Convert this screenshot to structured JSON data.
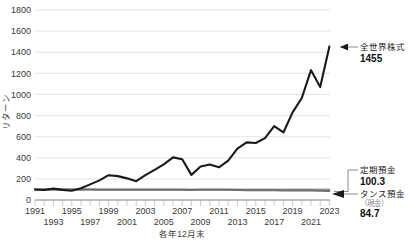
{
  "chart_data": {
    "type": "line",
    "title": "",
    "xlabel": "各年12月末",
    "ylabel": "リターン",
    "ylim": [
      0,
      1800
    ],
    "ytick_step": 200,
    "yticks": [
      "0",
      "200",
      "400",
      "600",
      "800",
      "1000",
      "1200",
      "1400",
      "1600",
      "1800"
    ],
    "xlim": [
      1991,
      2023
    ],
    "xticks_top": [
      "1991",
      "1995",
      "1999",
      "2003",
      "2007",
      "2011",
      "2015",
      "2019",
      "2023"
    ],
    "xticks_bottom": [
      "1993",
      "1997",
      "2001",
      "2005",
      "2009",
      "2013",
      "2017",
      "2021"
    ],
    "grid": true,
    "legend_position": "annotations-right",
    "x": [
      1991,
      1992,
      1993,
      1994,
      1995,
      1996,
      1997,
      1998,
      1999,
      2000,
      2001,
      2002,
      2003,
      2004,
      2005,
      2006,
      2007,
      2008,
      2009,
      2010,
      2011,
      2012,
      2013,
      2014,
      2015,
      2016,
      2017,
      2018,
      2019,
      2020,
      2021,
      2022,
      2023
    ],
    "series": [
      {
        "name": "全世界株式",
        "color": "#1a1a1a",
        "end_value": 1455,
        "values": [
          100,
          95,
          108,
          96,
          88,
          112,
          148,
          186,
          235,
          226,
          205,
          178,
          236,
          286,
          338,
          404,
          386,
          238,
          318,
          337,
          310,
          372,
          486,
          546,
          540,
          586,
          700,
          640,
          830,
          966,
          1230,
          1070,
          1455
        ]
      },
      {
        "name": "定期預金",
        "color": "#8c8c8c",
        "end_value": 100.3,
        "values": [
          100,
          100,
          100,
          100,
          100,
          100.1,
          100.1,
          100.1,
          100.1,
          100.1,
          100.2,
          100.2,
          100.2,
          100.2,
          100.2,
          100.2,
          100.2,
          100.3,
          100.3,
          100.3,
          100.3,
          100.3,
          100.3,
          100.3,
          100.3,
          100.3,
          100.3,
          100.3,
          100.3,
          100.3,
          100.3,
          100.3,
          100.3
        ]
      },
      {
        "name": "タンス預金（現金）",
        "color": "#5f5f5f",
        "end_value": 84.7,
        "values": [
          100,
          99.5,
          99.3,
          99.2,
          99.1,
          99.0,
          98.5,
          98.0,
          97.7,
          97.5,
          97.4,
          97.2,
          97.1,
          97.0,
          96.8,
          96.5,
          96.2,
          95.9,
          96.1,
          96.2,
          96.3,
          96.3,
          95.8,
          93.2,
          92.4,
          92.2,
          91.8,
          91.0,
          90.6,
          90.5,
          90.0,
          87.4,
          84.7
        ]
      }
    ],
    "annotations": [
      {
        "id": "world-equity",
        "label": "全世界株式",
        "value": "1455",
        "sub": ""
      },
      {
        "id": "time-deposit",
        "label": "定期預金",
        "value": "100.3",
        "sub": ""
      },
      {
        "id": "cash-hoard",
        "label": "タンス預金",
        "value": "84.7",
        "sub": "（現金）"
      }
    ]
  },
  "colors": {
    "equity_line": "#1a1a1a",
    "deposit_band": "#8c8c8c",
    "grid": "#d9d9d9",
    "axis": "#9a9a9a",
    "text": "#3b3b3b"
  }
}
